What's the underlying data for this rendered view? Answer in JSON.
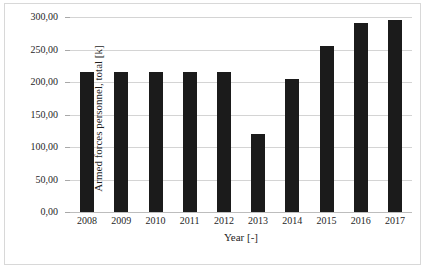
{
  "figure": {
    "background_color": "#ffffff",
    "frame_color": "#d8d8d8",
    "bar_color": "#1b1b1b",
    "gridline_color": "#d4d4d4"
  },
  "chart_data": {
    "type": "bar",
    "title": "",
    "xlabel": "Year [-]",
    "ylabel": "Armed forces personnel, total [k]",
    "categories": [
      "2008",
      "2009",
      "2010",
      "2011",
      "2012",
      "2013",
      "2014",
      "2015",
      "2016",
      "2017"
    ],
    "values": [
      215,
      215,
      215,
      215,
      215,
      120,
      204,
      255,
      291,
      296
    ],
    "ylim": [
      0,
      300
    ],
    "ytick_values": [
      0,
      50,
      100,
      150,
      200,
      250,
      300
    ],
    "ytick_labels": [
      "0,00",
      "50,00",
      "100,00",
      "150,00",
      "200,00",
      "250,00",
      "300,00"
    ],
    "grid": "horizontal",
    "legend": "none",
    "series": [
      {
        "name": "Armed forces personnel, total [k]",
        "values": [
          215,
          215,
          215,
          215,
          215,
          120,
          204,
          255,
          291,
          296
        ]
      }
    ]
  }
}
